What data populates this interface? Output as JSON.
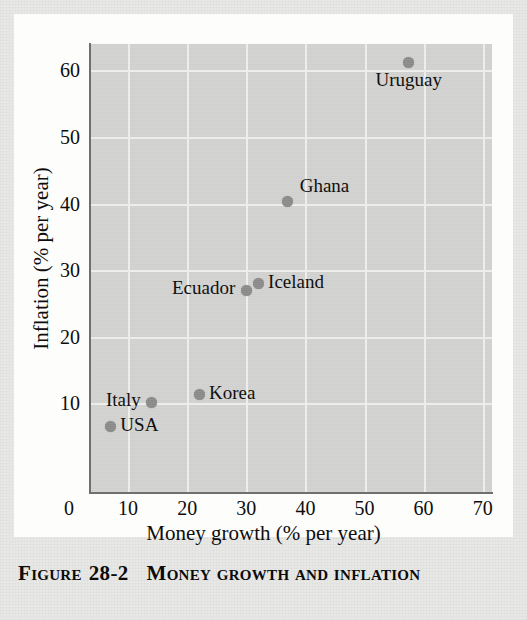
{
  "figure": {
    "caption_label": "Figure",
    "caption_number": "28-2",
    "caption_title": "Money growth and inflation"
  },
  "chart_data": {
    "type": "scatter",
    "title": "",
    "xlabel": "Money growth (% per year)",
    "ylabel": "Inflation (% per year)",
    "xlim": [
      0,
      70
    ],
    "ylim": [
      0,
      65
    ],
    "xticks": [
      "0",
      "10",
      "20",
      "30",
      "40",
      "50",
      "60",
      "70"
    ],
    "xtick_values": [
      0,
      10,
      20,
      30,
      40,
      50,
      60,
      70
    ],
    "yticks": [
      "10",
      "20",
      "30",
      "40",
      "50",
      "60"
    ],
    "ytick_values": [
      10,
      20,
      30,
      40,
      50,
      60
    ],
    "grid": true,
    "legend": "none",
    "marker_color": "#8b8b8b",
    "plot_background": "#d2d2d0",
    "gridline_color": "#eeeeec",
    "points": [
      {
        "name": "USA",
        "x": 7,
        "y": 6.5,
        "label_side": "right"
      },
      {
        "name": "Italy",
        "x": 14,
        "y": 10.2,
        "label_side": "left"
      },
      {
        "name": "Korea",
        "x": 22,
        "y": 11.3,
        "label_side": "right"
      },
      {
        "name": "Ecuador",
        "x": 30,
        "y": 27,
        "label_side": "left"
      },
      {
        "name": "Iceland",
        "x": 32,
        "y": 28,
        "label_side": "right"
      },
      {
        "name": "Ghana",
        "x": 37,
        "y": 40.3,
        "label_side": "upper-right"
      },
      {
        "name": "Uruguay",
        "x": 57.5,
        "y": 61.2,
        "label_side": "below"
      }
    ]
  }
}
